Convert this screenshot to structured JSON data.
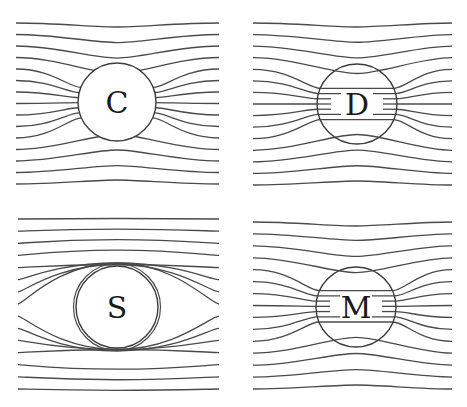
{
  "figure": {
    "width": 467,
    "height": 407,
    "line_color": "#4a4a4a",
    "circle_color": "#3c3c3c",
    "background": "#ffffff"
  },
  "panels": [
    {
      "label": "C",
      "kind": "conductor",
      "cx": 117,
      "cy": 102,
      "r": 39,
      "x0": 16,
      "x1": 219,
      "y_top": 23,
      "y_bottom": 184,
      "lines": 15
    },
    {
      "label": "D",
      "kind": "dielectric",
      "cx": 357,
      "cy": 104,
      "r": 40,
      "x0": 253,
      "x1": 452,
      "y_top": 23,
      "y_bottom": 185,
      "lines": 15
    },
    {
      "label": "S",
      "kind": "superconductor",
      "cx": 117,
      "cy": 307,
      "r": 41,
      "x0": 18,
      "x1": 219,
      "y_top": 219,
      "y_bottom": 389,
      "lines": 15
    },
    {
      "label": "M",
      "kind": "dielectric",
      "cx": 356,
      "cy": 307,
      "r": 40,
      "x0": 253,
      "x1": 452,
      "y_top": 222,
      "y_bottom": 389,
      "lines": 15
    }
  ]
}
